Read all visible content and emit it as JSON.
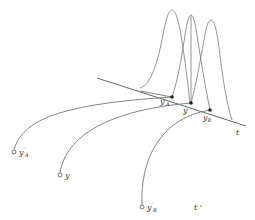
{
  "diagram": {
    "type": "geometric-illustration",
    "axis_line": {
      "label": "t",
      "from": [
        97,
        78
      ],
      "to": [
        246,
        126
      ]
    },
    "secondary_label": "t'",
    "points_on_t": [
      {
        "id": "yA_prime",
        "label": "y'",
        "sub": "A",
        "x": 172,
        "y": 97
      },
      {
        "id": "y",
        "label": "y",
        "sub": "",
        "x": 191,
        "y": 103
      },
      {
        "id": "yB",
        "label": "y",
        "sub": "B",
        "x": 210,
        "y": 110
      }
    ],
    "source_points": [
      {
        "id": "src_yA_prime",
        "label": "y'",
        "sub": "A",
        "x": 14,
        "y": 152
      },
      {
        "id": "src_y_prime",
        "label": "y'",
        "sub": "",
        "x": 60,
        "y": 175
      },
      {
        "id": "src_yB_prime",
        "label": "y'",
        "sub": "B",
        "x": 142,
        "y": 207
      }
    ],
    "peaks": [
      {
        "id": "peak-left",
        "center_x": 172,
        "top_y": 10
      },
      {
        "id": "peak-middle",
        "center_x": 191,
        "top_y": 15
      },
      {
        "id": "peak-right",
        "center_x": 211,
        "top_y": 20
      }
    ],
    "labels": {
      "t": "t",
      "t_prime": "t '",
      "yA_prime_main": "y",
      "yA_prime_sub": "A",
      "y_main": "y",
      "yB_main": "y",
      "yB_sub": "B",
      "src_yA_main": "y",
      "src_yA_sub": "A",
      "src_y_main": "y",
      "src_yB_main": "y",
      "src_yB_sub": "B",
      "prime": "′"
    },
    "colors": {
      "stroke": "#777777",
      "axis": "#555555",
      "dot": "#222222",
      "background": "#ffffff"
    }
  }
}
